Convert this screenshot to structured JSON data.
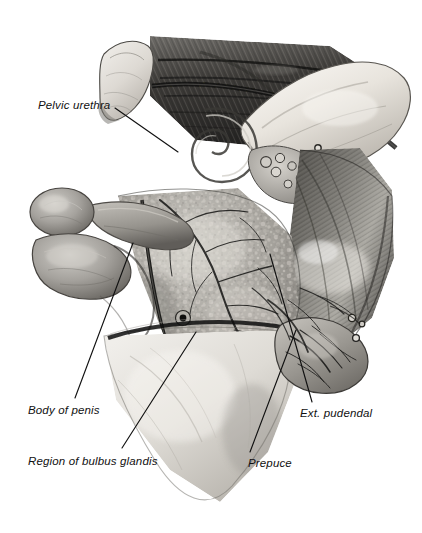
{
  "figure": {
    "medium": "grayscale pencil and airbrush anatomical illustration",
    "background_color": "#ffffff",
    "ink_color": "#111111",
    "width": 422,
    "height": 533
  },
  "labels": [
    {
      "id": "pelvic-urethra",
      "text": "Pelvic urethra",
      "x": 38,
      "y": 100,
      "leader": {
        "from": [
          115,
          108
        ],
        "to": [
          178,
          152
        ]
      }
    },
    {
      "id": "body-of-penis",
      "text": "Body of penis",
      "x": 28,
      "y": 405,
      "leader": {
        "from": [
          75,
          398
        ],
        "to": [
          133,
          243
        ]
      }
    },
    {
      "id": "region-of-bulbus-glandis",
      "text": "Region of bulbus glandis",
      "x": 28,
      "y": 456,
      "leader": {
        "from": [
          122,
          448
        ],
        "to": [
          196,
          332
        ]
      }
    },
    {
      "id": "prepuce",
      "text": "Prepuce",
      "x": 248,
      "y": 458,
      "leader": {
        "from": [
          250,
          452
        ],
        "to": [
          296,
          330
        ]
      }
    },
    {
      "id": "ext-pudendal",
      "text": "Ext. pudendal",
      "x": 300,
      "y": 408,
      "leader": {
        "from": [
          312,
          402
        ],
        "to": [
          270,
          254
        ]
      }
    }
  ],
  "structures": [
    {
      "id": "cut-bone-end",
      "name": "cut bone end (cranial)",
      "tone": "#d8d6d2"
    },
    {
      "id": "striated-muscle-band",
      "name": "striated muscle band (dorsal)",
      "tone": "#4a4a4a"
    },
    {
      "id": "pelvic-bone",
      "name": "pelvic bone / ischium",
      "tone": "#e6e4df"
    },
    {
      "id": "cut-vessels",
      "name": "cut vessels in fat",
      "tone": "#8a8a8a"
    },
    {
      "id": "bulb-structure",
      "name": "bulbous structure (left)",
      "tone": "#9a9894"
    },
    {
      "id": "glandular-mass",
      "name": "mottled glandular mass (central)",
      "tone": "#a8a6a1"
    },
    {
      "id": "vascular-network",
      "name": "branching vessel network",
      "tone": "#2a2a2a"
    },
    {
      "id": "semimembranosus",
      "name": "striated muscle (right)",
      "tone": "#6f6d69"
    },
    {
      "id": "skin-flap",
      "name": "reflected skin flap (ventral)",
      "tone": "#dcdad6"
    }
  ]
}
